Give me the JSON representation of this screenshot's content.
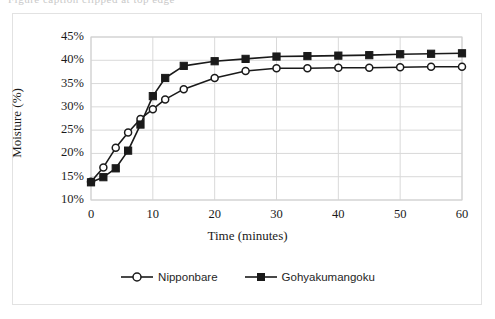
{
  "ghost_text": "Figure caption clipped at top edge",
  "chart_data": {
    "type": "line",
    "title": "",
    "xlabel": "Time (minutes)",
    "ylabel": "Moisture (%)",
    "xlim": [
      0,
      60
    ],
    "ylim": [
      10,
      45
    ],
    "xticks": [
      "0",
      "10",
      "20",
      "30",
      "40",
      "50",
      "60"
    ],
    "xtick_values": [
      0,
      10,
      20,
      30,
      40,
      50,
      60
    ],
    "yticks": [
      "10%",
      "15%",
      "20%",
      "25%",
      "30%",
      "35%",
      "40%",
      "45%"
    ],
    "ytick_values": [
      10,
      15,
      20,
      25,
      30,
      35,
      40,
      45
    ],
    "grid": "horizontal-and-vertical",
    "legend_position": "bottom-center",
    "x": [
      0,
      2,
      4,
      6,
      8,
      10,
      12,
      15,
      20,
      25,
      30,
      35,
      40,
      45,
      50,
      55,
      60
    ],
    "series": [
      {
        "name": "Nipponbare",
        "marker": "open-circle",
        "color": "#1a1a1a",
        "values": [
          13.9,
          17.0,
          21.2,
          24.5,
          27.4,
          29.5,
          31.6,
          33.8,
          36.2,
          37.7,
          38.3,
          38.3,
          38.4,
          38.4,
          38.5,
          38.6,
          38.6
        ]
      },
      {
        "name": "Gohyakumangoku",
        "marker": "filled-square",
        "color": "#1a1a1a",
        "values": [
          13.8,
          14.9,
          16.8,
          20.6,
          26.2,
          32.3,
          36.2,
          38.8,
          39.8,
          40.3,
          40.8,
          40.9,
          41.0,
          41.1,
          41.3,
          41.4,
          41.5
        ]
      }
    ]
  },
  "legend": {
    "items": [
      {
        "label": "Nipponbare",
        "marker": "open-circle"
      },
      {
        "label": "Gohyakumangoku",
        "marker": "filled-square"
      }
    ]
  }
}
